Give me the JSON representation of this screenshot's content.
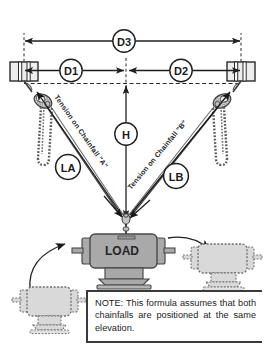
{
  "diagram": {
    "labels": {
      "d3": "D3",
      "d1": "D1",
      "d2": "D2",
      "h": "H",
      "la": "LA",
      "lb": "LB",
      "load": "LOAD",
      "tension_a": "Tension on Chainfall \"A\"",
      "tension_b": "Tension on Chainfall \"B\""
    },
    "note": {
      "text": "NOTE: This formula assumes that both chainfalls are positioned at the same elevation."
    },
    "colors": {
      "line": "#1f1f1f",
      "rule": "#3a3a3a",
      "body_fill": "#a9a9a9",
      "body_stroke": "#4a4a4a",
      "ghost_fill": "#d9d9d9",
      "ghost_stroke": "#6e6e6e",
      "beam_fill": "#ededed",
      "bubble_fill": "#ffffff"
    },
    "icons": {
      "left_anchor": "beam-anchor-icon",
      "right_anchor": "beam-anchor-icon",
      "left_chainfall": "chainfall-hoist-icon",
      "right_chainfall": "chainfall-hoist-icon",
      "ghost_left": "ghost-load-icon",
      "ghost_right": "ghost-load-icon"
    }
  }
}
